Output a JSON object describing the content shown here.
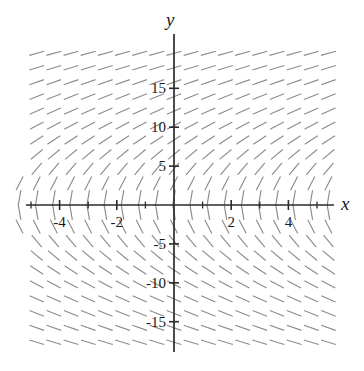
{
  "figure": {
    "kind": "slope-field",
    "background_color": "#ffffff",
    "axis_color": "#2b2b2b",
    "segment_color": "#8c8c8c",
    "label_color": "#1a1a1a"
  },
  "axes": {
    "x_axis_label": "x",
    "y_axis_label": "y",
    "x_ticks": [
      {
        "value": -4,
        "label": "-4"
      },
      {
        "value": -2,
        "label": "-2"
      },
      {
        "value": 2,
        "label": "2"
      },
      {
        "value": 4,
        "label": "4"
      }
    ],
    "y_ticks": [
      {
        "value": 15,
        "label": "15"
      },
      {
        "value": 10,
        "label": "10"
      },
      {
        "value": 5,
        "label": "5"
      },
      {
        "value": -5,
        "label": "-5"
      },
      {
        "value": -10,
        "label": "-10"
      },
      {
        "value": -15,
        "label": "-15"
      }
    ],
    "x_ticks_unlabeled": [
      -5,
      -3,
      -1,
      1,
      3,
      5
    ],
    "x_range": [
      -5.6,
      5.6
    ],
    "y_range": [
      -20.5,
      20.5
    ]
  },
  "chart_data": {
    "type": "scatter",
    "plot_kind": "slope-field",
    "title": "",
    "xlabel": "x",
    "ylabel": "y",
    "xlim": [
      -5.6,
      5.6
    ],
    "ylim": [
      -20.5,
      20.5
    ],
    "grid": false,
    "legend": "none",
    "slope_expression": "dy/dx = 20 / y",
    "sample_x": [
      -5,
      -4,
      -3,
      -2,
      -1,
      0,
      1,
      2,
      3,
      4,
      5
    ],
    "sample_y": [
      -18,
      -15,
      -12,
      -9,
      -6,
      -3,
      3,
      6,
      9,
      12,
      15,
      18
    ],
    "sample_slopes_by_y": [
      {
        "y": 18,
        "slope": 1.11
      },
      {
        "y": 15,
        "slope": 1.33
      },
      {
        "y": 12,
        "slope": 1.67
      },
      {
        "y": 9,
        "slope": 2.22
      },
      {
        "y": 6,
        "slope": 3.33
      },
      {
        "y": 3,
        "slope": 6.67
      },
      {
        "y": -3,
        "slope": -6.67
      },
      {
        "y": -6,
        "slope": -3.33
      },
      {
        "y": -9,
        "slope": -2.22
      },
      {
        "y": -12,
        "slope": -1.67
      },
      {
        "y": -15,
        "slope": -1.33
      },
      {
        "y": -18,
        "slope": -1.11
      }
    ],
    "grid_columns": 19,
    "grid_rows": 22
  }
}
